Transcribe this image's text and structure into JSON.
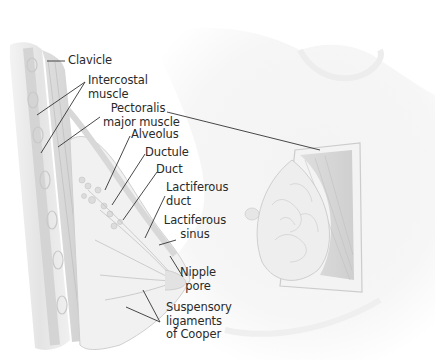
{
  "figure": {
    "labels": [
      {
        "id": "clavicle",
        "lines": [
          "Clavicle"
        ]
      },
      {
        "id": "intercostal-muscle",
        "lines": [
          "Intercostal",
          "muscle"
        ]
      },
      {
        "id": "pectoralis-major-muscle",
        "lines": [
          "Pectoralis",
          "major muscle"
        ]
      },
      {
        "id": "alveolus",
        "lines": [
          "Alveolus"
        ]
      },
      {
        "id": "ductule",
        "lines": [
          "Ductule"
        ]
      },
      {
        "id": "duct",
        "lines": [
          "Duct"
        ]
      },
      {
        "id": "lactiferous-duct",
        "lines": [
          "Lactiferous",
          "duct"
        ]
      },
      {
        "id": "lactiferous-sinus",
        "lines": [
          "Lactiferous",
          "sinus"
        ]
      },
      {
        "id": "nipple-pore",
        "lines": [
          "Nipple",
          "pore"
        ]
      },
      {
        "id": "suspensory-ligaments",
        "lines": [
          "Suspensory",
          "ligaments",
          "of Cooper"
        ]
      }
    ]
  },
  "colors": {
    "label_text": "#2a2a2a",
    "leader_line": "#333333",
    "tissue_light": "#ececec",
    "tissue_mid": "#d6d6d6",
    "muscle": "#c9c9c9",
    "outline": "#bdbdbd"
  }
}
